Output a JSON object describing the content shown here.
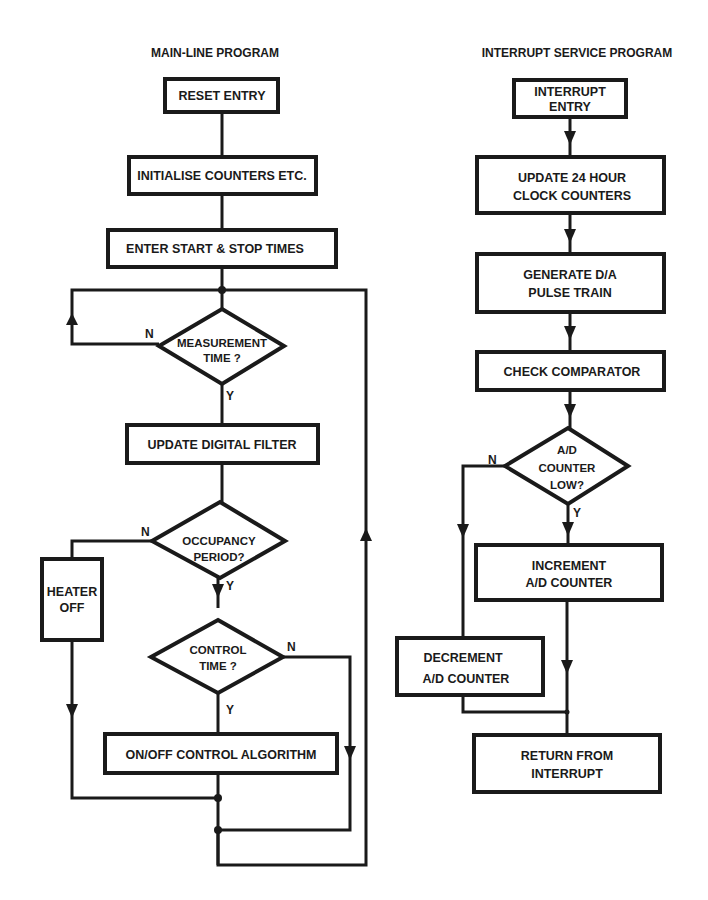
{
  "main_line": {
    "title": "MAIN-LINE PROGRAM",
    "reset_entry": "RESET ENTRY",
    "initialise": "INITIALISE COUNTERS ETC.",
    "enter_times": "ENTER START & STOP TIMES",
    "measurement_time": {
      "line1": "MEASUREMENT",
      "line2": "TIME ?",
      "yes": "Y",
      "no": "N"
    },
    "update_filter": "UPDATE DIGITAL FILTER",
    "occupancy_period": {
      "line1": "OCCUPANCY",
      "line2": "PERIOD?",
      "yes": "Y",
      "no": "N"
    },
    "heater_off": {
      "line1": "HEATER",
      "line2": "OFF"
    },
    "control_time": {
      "line1": "CONTROL",
      "line2": "TIME ?",
      "yes": "Y",
      "no": "N"
    },
    "on_off_control": "ON/OFF CONTROL ALGORITHM"
  },
  "interrupt": {
    "title": "INTERRUPT SERVICE PROGRAM",
    "entry": {
      "line1": "INTERRUPT",
      "line2": "ENTRY"
    },
    "update_clock": {
      "line1": "UPDATE 24 HOUR",
      "line2": "CLOCK COUNTERS"
    },
    "generate_da": {
      "line1": "GENERATE D/A",
      "line2": "PULSE TRAIN"
    },
    "check_comparator": "CHECK COMPARATOR",
    "ad_counter_low": {
      "line1": "A/D",
      "line2": "COUNTER",
      "line3": "LOW?",
      "yes": "Y",
      "no": "N"
    },
    "increment": {
      "line1": "INCREMENT",
      "line2": "A/D COUNTER"
    },
    "decrement": {
      "line1": "DECREMENT",
      "line2": "A/D COUNTER"
    },
    "return": {
      "line1": "RETURN FROM",
      "line2": "INTERRUPT"
    }
  }
}
